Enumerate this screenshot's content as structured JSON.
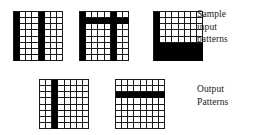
{
  "figure": {
    "title_alt": "Sample input patterns and output patterns on 8x8 binary grids",
    "colors": {
      "ink": "#000000",
      "grid_line": "#1a1a1a",
      "background": "#ffffff"
    }
  },
  "labels": {
    "sample_input": {
      "lines": [
        "Sample",
        "input",
        "patterns"
      ]
    },
    "output": {
      "lines": [
        "Output",
        "Patterns"
      ]
    }
  },
  "chart_data": {
    "type": "heatmap",
    "legend_position": "right",
    "grid": true,
    "cell_states": [
      "off",
      "on"
    ],
    "panels": [
      {
        "name": "input-pattern-1",
        "group": "Sample input patterns",
        "rows": 8,
        "cols": 8,
        "x": 13,
        "y": 11,
        "width": 50,
        "height": 50,
        "values": [
          [
            1,
            0,
            0,
            0,
            1,
            0,
            0,
            0
          ],
          [
            1,
            0,
            0,
            0,
            1,
            0,
            0,
            0
          ],
          [
            1,
            0,
            0,
            0,
            1,
            0,
            0,
            0
          ],
          [
            1,
            0,
            0,
            0,
            1,
            0,
            0,
            0
          ],
          [
            1,
            0,
            0,
            0,
            1,
            0,
            0,
            0
          ],
          [
            1,
            0,
            0,
            0,
            1,
            0,
            0,
            0
          ],
          [
            1,
            0,
            0,
            0,
            1,
            0,
            0,
            0
          ],
          [
            1,
            0,
            0,
            0,
            1,
            0,
            0,
            0
          ]
        ]
      },
      {
        "name": "input-pattern-2",
        "group": "Sample input patterns",
        "rows": 8,
        "cols": 8,
        "x": 79,
        "y": 11,
        "width": 50,
        "height": 50,
        "values": [
          [
            1,
            0,
            0,
            0,
            0,
            1,
            0,
            0
          ],
          [
            1,
            1,
            1,
            1,
            1,
            1,
            1,
            1
          ],
          [
            1,
            0,
            0,
            0,
            0,
            1,
            0,
            0
          ],
          [
            1,
            0,
            0,
            0,
            0,
            1,
            0,
            0
          ],
          [
            1,
            0,
            0,
            0,
            0,
            1,
            0,
            0
          ],
          [
            1,
            0,
            0,
            0,
            0,
            1,
            0,
            0
          ],
          [
            1,
            0,
            0,
            0,
            0,
            1,
            0,
            0
          ],
          [
            1,
            0,
            0,
            0,
            0,
            1,
            0,
            0
          ]
        ]
      },
      {
        "name": "input-pattern-3",
        "group": "Sample input patterns",
        "rows": 8,
        "cols": 8,
        "x": 153,
        "y": 11,
        "width": 50,
        "height": 50,
        "values": [
          [
            1,
            0,
            0,
            0,
            0,
            0,
            0,
            0
          ],
          [
            1,
            0,
            0,
            0,
            0,
            0,
            0,
            0
          ],
          [
            1,
            0,
            0,
            0,
            0,
            0,
            0,
            0
          ],
          [
            1,
            0,
            0,
            0,
            0,
            0,
            0,
            0
          ],
          [
            1,
            0,
            0,
            0,
            0,
            0,
            0,
            0
          ],
          [
            1,
            1,
            1,
            1,
            1,
            1,
            1,
            1
          ],
          [
            1,
            1,
            1,
            1,
            1,
            1,
            1,
            1
          ],
          [
            1,
            1,
            1,
            1,
            1,
            1,
            1,
            1
          ]
        ]
      },
      {
        "name": "output-pattern-1",
        "group": "Output Patterns",
        "rows": 8,
        "cols": 8,
        "x": 39,
        "y": 79,
        "width": 50,
        "height": 50,
        "values": [
          [
            0,
            0,
            1,
            0,
            0,
            0,
            0,
            0
          ],
          [
            0,
            0,
            1,
            0,
            0,
            0,
            0,
            0
          ],
          [
            0,
            0,
            1,
            0,
            0,
            0,
            0,
            0
          ],
          [
            0,
            0,
            1,
            0,
            0,
            0,
            0,
            0
          ],
          [
            0,
            0,
            1,
            0,
            0,
            0,
            0,
            0
          ],
          [
            0,
            0,
            1,
            0,
            0,
            0,
            0,
            0
          ],
          [
            0,
            0,
            1,
            0,
            0,
            0,
            0,
            0
          ],
          [
            0,
            0,
            1,
            0,
            0,
            0,
            0,
            0
          ]
        ]
      },
      {
        "name": "output-pattern-2",
        "group": "Output Patterns",
        "rows": 8,
        "cols": 8,
        "x": 115,
        "y": 79,
        "width": 50,
        "height": 50,
        "values": [
          [
            0,
            0,
            0,
            0,
            0,
            0,
            0,
            0
          ],
          [
            0,
            0,
            0,
            0,
            0,
            0,
            0,
            0
          ],
          [
            1,
            1,
            1,
            1,
            1,
            1,
            1,
            1
          ],
          [
            0,
            0,
            0,
            0,
            0,
            0,
            0,
            0
          ],
          [
            0,
            0,
            0,
            0,
            0,
            0,
            0,
            0
          ],
          [
            0,
            0,
            0,
            0,
            0,
            0,
            0,
            0
          ],
          [
            0,
            0,
            0,
            0,
            0,
            0,
            0,
            0
          ],
          [
            0,
            0,
            0,
            0,
            0,
            0,
            0,
            0
          ]
        ]
      }
    ]
  }
}
